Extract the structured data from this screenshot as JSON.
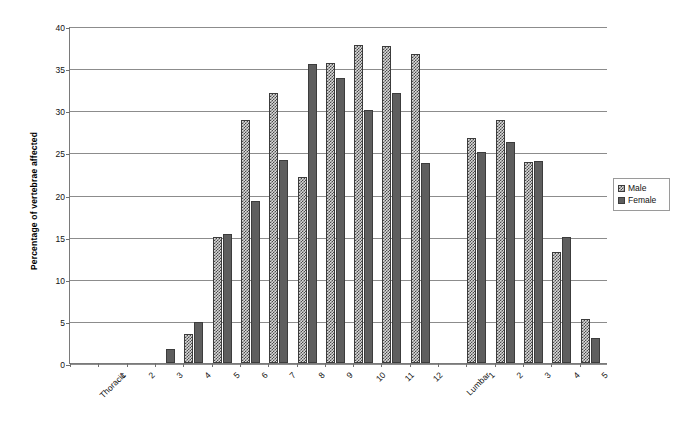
{
  "chart_data": {
    "type": "bar",
    "title": "",
    "xlabel": "",
    "ylabel": "Percentage of vertebrae affected",
    "ylim": [
      0,
      40
    ],
    "ytick_step": 5,
    "yticks": [
      0,
      5,
      10,
      15,
      20,
      25,
      30,
      35,
      40
    ],
    "grid": true,
    "legend_position": "right",
    "categories": [
      "Thoracic",
      "1",
      "2",
      "3",
      "4",
      "5",
      "6",
      "7",
      "8",
      "9",
      "10",
      "11",
      "12",
      "Lumbar",
      "1",
      "2",
      "3",
      "4",
      "5"
    ],
    "series": [
      {
        "name": "Male",
        "values": [
          null,
          0,
          0,
          0,
          3.4,
          14.9,
          28.9,
          32.1,
          22.1,
          35.6,
          37.8,
          37.6,
          36.7,
          null,
          26.7,
          28.8,
          23.9,
          13.2,
          5.2
        ]
      },
      {
        "name": "Female",
        "values": [
          null,
          0,
          0,
          1.7,
          4.9,
          15.3,
          19.2,
          24.1,
          35.5,
          33.8,
          30.0,
          32.1,
          23.7,
          null,
          25.0,
          26.2,
          24.0,
          15.0,
          3.0
        ]
      }
    ],
    "colors": {
      "male": "#d9d9d9",
      "female": "#5e5e5e",
      "grid": "#8c8c8c",
      "axis": "#7a7a7a"
    }
  },
  "legend": {
    "items": [
      {
        "label": "Male",
        "key": "male"
      },
      {
        "label": "Female",
        "key": "female"
      }
    ]
  }
}
